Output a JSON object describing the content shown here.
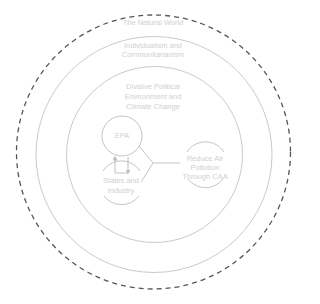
{
  "diagram": {
    "colors": {
      "outer_dashed": "#555555",
      "rings": "#c8c8c8",
      "text": "#d0d0d0"
    },
    "rings": [
      {
        "id": "natural-world",
        "label": "The Natural World",
        "style": "dashed"
      },
      {
        "id": "individualism",
        "label": "Individualism and\nCommunitarianism",
        "style": "solid"
      },
      {
        "id": "divisive-political",
        "label": "Divisive Political\nEnvironment and\nClimate Change",
        "style": "solid"
      }
    ],
    "nodes": {
      "epa": {
        "label": "EPA"
      },
      "states": {
        "label": "States and\nIndustry"
      },
      "goal": {
        "label": "Reduce Air\nPollution\nThrough CAA"
      }
    },
    "labels": {
      "natural_world": "The Natural World",
      "individualism_1": "Individualism and",
      "individualism_2": "Communitarianism",
      "divisive_1": "Divisive Political",
      "divisive_2": "Environment and",
      "divisive_3": "Climate Change",
      "epa": "EPA",
      "states_1": "States and",
      "states_2": "Industry",
      "goal_1": "Reduce Air",
      "goal_2": "Pollution",
      "goal_3": "Through CAA"
    }
  }
}
